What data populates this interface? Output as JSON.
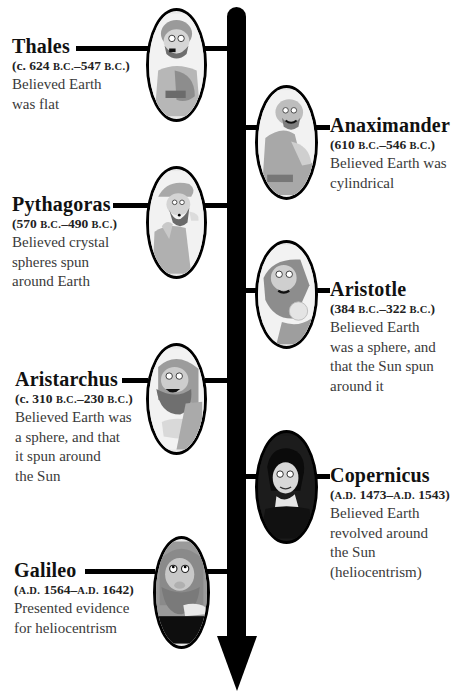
{
  "timeline": {
    "direction": "top-to-bottom",
    "arrow_color": "#000000",
    "entries": [
      {
        "name": "Thales",
        "date_prefix": "(c. 624 ",
        "date_era1": "B.C.",
        "date_mid": "–547 ",
        "date_era2": "B.C.",
        "date_suffix": ")",
        "dates_text": "(c. 624 B.C.–547 B.C.)",
        "description": "Believed Earth\nwas flat",
        "side": "left",
        "portrait": "thales-portrait"
      },
      {
        "name": "Anaximander",
        "date_prefix": "(610 ",
        "date_era1": "B.C.",
        "date_mid": "–546 ",
        "date_era2": "B.C.",
        "date_suffix": ")",
        "dates_text": "(610 B.C.–546 B.C.)",
        "description": "Believed Earth was\ncylindrical",
        "side": "right",
        "portrait": "anaximander-portrait"
      },
      {
        "name": "Pythagoras",
        "date_prefix": "(570 ",
        "date_era1": "B.C.",
        "date_mid": "–490 ",
        "date_era2": "B.C.",
        "date_suffix": ")",
        "dates_text": "(570 B.C.–490 B.C.)",
        "description": "Believed crystal\nspheres spun\naround Earth",
        "side": "left",
        "portrait": "pythagoras-portrait"
      },
      {
        "name": "Aristotle",
        "date_prefix": "(384 ",
        "date_era1": "B.C.",
        "date_mid": "–322 ",
        "date_era2": "B.C.",
        "date_suffix": ")",
        "dates_text": "(384 B.C.–322 B.C.)",
        "description": "Believed Earth\nwas a sphere, and\nthat the Sun spun\naround it",
        "side": "right",
        "portrait": "aristotle-portrait"
      },
      {
        "name": "Aristarchus",
        "date_prefix": "(c. 310 ",
        "date_era1": "B.C.",
        "date_mid": "–230 ",
        "date_era2": "B.C.",
        "date_suffix": ")",
        "dates_text": "(c. 310 B.C.–230 B.C.)",
        "description": "Believed Earth was\na sphere, and that\nit spun around\nthe Sun",
        "side": "left",
        "portrait": "aristarchus-portrait"
      },
      {
        "name": "Copernicus",
        "date_prefix": "(",
        "date_era1": "A.D.",
        "date_mid": " 1473–",
        "date_era2": "A.D.",
        "date_suffix": " 1543)",
        "dates_text": "(A.D. 1473–A.D. 1543)",
        "description": "Believed Earth\nrevolved around\nthe Sun\n(heliocentrism)",
        "side": "right",
        "portrait": "copernicus-portrait"
      },
      {
        "name": "Galileo",
        "date_prefix": "(",
        "date_era1": "A.D.",
        "date_mid": " 1564–",
        "date_era2": "A.D.",
        "date_suffix": " 1642)",
        "dates_text": "(A.D. 1564–A.D. 1642)",
        "description": "Presented evidence\nfor heliocentrism",
        "side": "left",
        "portrait": "galileo-portrait"
      }
    ]
  }
}
